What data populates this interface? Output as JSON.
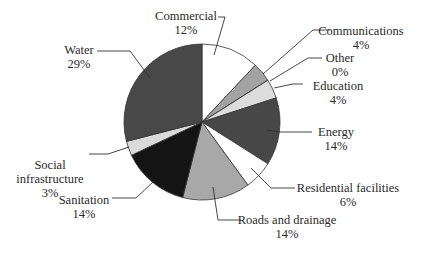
{
  "chart_data": {
    "type": "pie",
    "title": "",
    "start_angle_deg": 0,
    "direction": "clockwise",
    "center": [
      202,
      122
    ],
    "radius": 78,
    "slices": [
      {
        "label": "Commercial",
        "value": 12,
        "pct_text": "12%",
        "color": "#ffffff",
        "label_lines": [
          "Commercial"
        ],
        "label_x": 186,
        "label_y": 20,
        "anchor": "middle",
        "leader": [
          [
            214,
            55
          ],
          [
            225,
            17
          ],
          [
            218,
            17
          ]
        ]
      },
      {
        "label": "Communications",
        "value": 4,
        "pct_text": "4%",
        "color": "#a3a3a3",
        "label_lines": [
          "Communications"
        ],
        "label_x": 361,
        "label_y": 35,
        "anchor": "middle",
        "leader": [
          [
            263,
            74
          ],
          [
            313,
            30
          ],
          [
            330,
            30
          ]
        ]
      },
      {
        "label": "Other",
        "value": 0,
        "pct_text": "0%",
        "color": "#e0e0e0",
        "label_lines": [
          "Other"
        ],
        "label_x": 340,
        "label_y": 62,
        "anchor": "middle",
        "leader": [
          [
            270,
            81
          ],
          [
            308,
            58
          ],
          [
            322,
            58
          ]
        ]
      },
      {
        "label": "Education",
        "value": 4,
        "pct_text": "4%",
        "color": "#dcdcdc",
        "label_lines": [
          "Education"
        ],
        "label_x": 338,
        "label_y": 90,
        "anchor": "middle",
        "leader": [
          [
            274,
            88
          ],
          [
            293,
            84
          ],
          [
            303,
            84
          ]
        ]
      },
      {
        "label": "Energy",
        "value": 14,
        "pct_text": "14%",
        "color": "#474747",
        "label_lines": [
          "Energy"
        ],
        "label_x": 336,
        "label_y": 136,
        "anchor": "middle",
        "leader": [
          [
            267,
            130
          ],
          [
            281,
            132
          ],
          [
            312,
            132
          ]
        ]
      },
      {
        "label": "Residential facilities",
        "value": 6,
        "pct_text": "6%",
        "color": "#ffffff",
        "label_lines": [
          "Residential facilities"
        ],
        "label_x": 348,
        "label_y": 192,
        "anchor": "middle",
        "leader": [
          [
            251,
            168
          ],
          [
            271,
            188
          ],
          [
            295,
            188
          ]
        ]
      },
      {
        "label": "Roads and drainage",
        "value": 14,
        "pct_text": "14%",
        "color": "#a8a8a8",
        "label_lines": [
          "Roads and drainage"
        ],
        "label_x": 287,
        "label_y": 224,
        "anchor": "middle",
        "leader": [
          [
            213,
            187
          ],
          [
            218,
            220
          ],
          [
            241,
            220
          ]
        ]
      },
      {
        "label": "Sanitation",
        "value": 14,
        "pct_text": "14%",
        "color": "#141414",
        "label_lines": [
          "Sanitation"
        ],
        "label_x": 84,
        "label_y": 204,
        "anchor": "middle",
        "leader": [
          [
            153,
            182
          ],
          [
            136,
            198
          ],
          [
            112,
            198
          ]
        ]
      },
      {
        "label": "Social infrastructure",
        "value": 3,
        "pct_text": "3%",
        "color": "#dadada",
        "label_lines": [
          "Social",
          "infrastructure"
        ],
        "label_x": 50,
        "label_y": 169,
        "anchor": "middle",
        "leader": [
          [
            129,
            147
          ],
          [
            108,
            154
          ],
          [
            89,
            154
          ]
        ]
      },
      {
        "label": "Water",
        "value": 29,
        "pct_text": "29%",
        "color": "#484848",
        "label_lines": [
          "Water"
        ],
        "label_x": 79,
        "label_y": 54,
        "anchor": "middle",
        "leader": [
          [
            150,
            78
          ],
          [
            130,
            51
          ],
          [
            97,
            51
          ]
        ]
      }
    ]
  }
}
